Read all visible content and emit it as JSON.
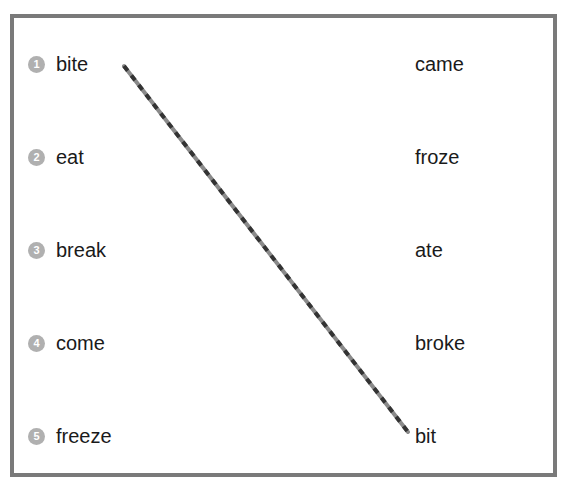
{
  "exercise": {
    "top_fragment": "Match the verbs to their past forms",
    "left_items": [
      {
        "number": "1",
        "word": "bite"
      },
      {
        "number": "2",
        "word": "eat"
      },
      {
        "number": "3",
        "word": "break"
      },
      {
        "number": "4",
        "word": "come"
      },
      {
        "number": "5",
        "word": "freeze"
      }
    ],
    "right_items": [
      {
        "word": "came"
      },
      {
        "word": "froze"
      },
      {
        "word": "ate"
      },
      {
        "word": "broke"
      },
      {
        "word": "bit"
      }
    ],
    "connection": {
      "from": "bite",
      "to": "bit",
      "color_dark": "#333333",
      "color_light": "#8a8a8a"
    },
    "colors": {
      "border": "#7a7a7a",
      "number_badge": "#b0b0b0",
      "text": "#1a1a1a"
    }
  }
}
